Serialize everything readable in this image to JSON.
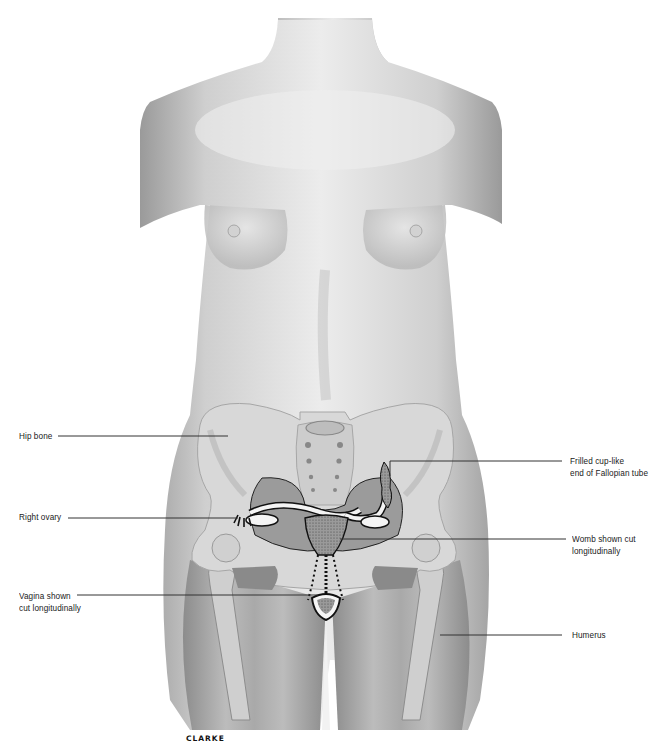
{
  "figure": {
    "signature": "CLARKE",
    "colors": {
      "background": "#ffffff",
      "skin_light": "#e6e6e6",
      "skin_mid": "#b5b5b5",
      "skin_dark": "#8a8a8a",
      "bone": "#d9d9d9",
      "organ_outline": "#111111",
      "leader_line": "#333333"
    }
  },
  "labels": {
    "hip_bone": {
      "lines": [
        "Hip bone"
      ]
    },
    "right_ovary": {
      "lines": [
        "Right ovary"
      ]
    },
    "vagina": {
      "lines": [
        "Vagina shown",
        "cut longitudinally"
      ]
    },
    "frilled": {
      "lines": [
        "Frilled cup-like",
        "end of Fallopian tube"
      ]
    },
    "womb": {
      "lines": [
        "Womb shown cut",
        "longitudinally"
      ]
    },
    "humerus": {
      "lines": [
        "Humerus"
      ]
    }
  }
}
